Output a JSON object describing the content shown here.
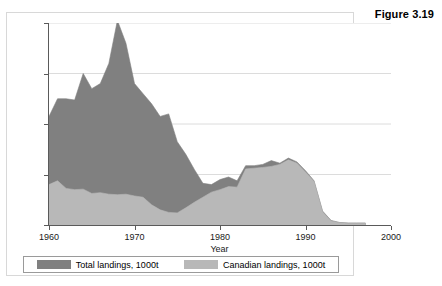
{
  "figure": {
    "label": "Figure 3.19"
  },
  "chart_data": {
    "type": "area",
    "stacked": false,
    "title": "",
    "subtitle": "",
    "xlabel": "Year",
    "ylabel": "",
    "xlim": [
      1960,
      2000
    ],
    "ylim": [
      0,
      800
    ],
    "grid": true,
    "grid_axis": "y",
    "legend_position": "bottom",
    "xticks": [
      1960,
      1970,
      1980,
      1990,
      2000
    ],
    "xtick_labels": [
      "1960",
      "1970",
      "1980",
      "1990",
      "2000"
    ],
    "yticks": [
      0,
      200,
      400,
      600,
      800
    ],
    "ytick_labels": [
      "0",
      "200",
      "400",
      "600",
      "800"
    ],
    "colors": {
      "total": "#808080",
      "canadian": "#b8b8b8",
      "axis": "#5a5a5a",
      "grid": "#dcdcdc",
      "panel_border": "#d8d8d8",
      "background": "#ffffff",
      "text": "#1a1a1a"
    },
    "x": [
      1960,
      1961,
      1962,
      1963,
      1964,
      1965,
      1966,
      1967,
      1968,
      1969,
      1970,
      1971,
      1972,
      1973,
      1974,
      1975,
      1976,
      1977,
      1978,
      1979,
      1980,
      1981,
      1982,
      1983,
      1984,
      1985,
      1986,
      1987,
      1988,
      1989,
      1990,
      1991,
      1992,
      1993,
      1994,
      1995,
      1996,
      1997
    ],
    "series": [
      {
        "name": "Total landings, 1000t",
        "color": "#808080",
        "values": [
          430,
          500,
          500,
          495,
          600,
          540,
          560,
          640,
          810,
          720,
          560,
          520,
          480,
          430,
          440,
          330,
          280,
          220,
          165,
          160,
          180,
          190,
          175,
          235,
          235,
          240,
          255,
          245,
          265,
          250,
          215,
          175,
          55,
          18,
          10,
          8,
          8,
          8
        ]
      },
      {
        "name": "Canadian landings, 1000t",
        "color": "#b8b8b8",
        "values": [
          160,
          175,
          145,
          140,
          142,
          125,
          128,
          122,
          120,
          122,
          115,
          110,
          80,
          60,
          50,
          48,
          68,
          90,
          110,
          130,
          140,
          152,
          150,
          222,
          225,
          228,
          232,
          240,
          258,
          245,
          210,
          172,
          52,
          16,
          9,
          7,
          7,
          7
        ]
      }
    ]
  },
  "legend": {
    "items": [
      {
        "label": "Total landings, 1000t",
        "color": "#808080"
      },
      {
        "label": "Canadian landings, 1000t",
        "color": "#b8b8b8"
      }
    ]
  }
}
